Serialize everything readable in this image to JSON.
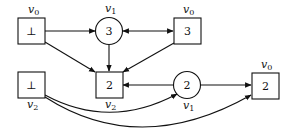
{
  "diagram": {
    "type": "game-graph",
    "nodes": [
      {
        "id": "n0",
        "shape": "square",
        "value": "⊥",
        "var": "v",
        "sub": "0",
        "label_pos": "above",
        "x": 18,
        "y": 18
      },
      {
        "id": "n1",
        "shape": "circle",
        "value": "3",
        "var": "v",
        "sub": "1",
        "label_pos": "above",
        "cx": 109,
        "cy": 31
      },
      {
        "id": "n2",
        "shape": "square",
        "value": "3",
        "var": "v",
        "sub": "0",
        "label_pos": "above",
        "x": 174,
        "y": 18
      },
      {
        "id": "n3",
        "shape": "square",
        "value": "⊥",
        "var": "v",
        "sub": "2",
        "label_pos": "below",
        "x": 18,
        "y": 72
      },
      {
        "id": "n4",
        "shape": "square",
        "value": "2",
        "var": "v",
        "sub": "2",
        "label_pos": "below",
        "x": 96,
        "y": 72
      },
      {
        "id": "n5",
        "shape": "circle",
        "value": "2",
        "var": "v",
        "sub": "1",
        "label_pos": "below",
        "cx": 187,
        "cy": 85
      },
      {
        "id": "n6",
        "shape": "square",
        "value": "2",
        "var": "v",
        "sub": "0",
        "label_pos": "above",
        "x": 252,
        "y": 73
      }
    ],
    "edges": [
      {
        "from": "n0",
        "to": "n1",
        "type": "straight"
      },
      {
        "from": "n1",
        "to": "n2",
        "type": "bidirectional"
      },
      {
        "from": "n0",
        "to": "n4",
        "type": "straight"
      },
      {
        "from": "n1",
        "to": "n4",
        "type": "straight"
      },
      {
        "from": "n2",
        "to": "n4",
        "type": "straight"
      },
      {
        "from": "n5",
        "to": "n4",
        "type": "straight"
      },
      {
        "from": "n5",
        "to": "n6",
        "type": "straight"
      },
      {
        "from": "n3",
        "to": "n5",
        "type": "curved"
      },
      {
        "from": "n3",
        "to": "n6",
        "type": "curved"
      }
    ]
  }
}
